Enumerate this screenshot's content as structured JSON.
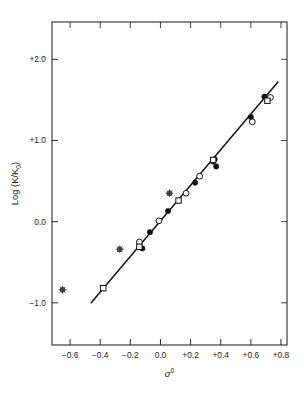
{
  "chart_data": {
    "type": "scatter",
    "title": "",
    "xlabel": "σ⁰",
    "ylabel": "Log (K/K₀)",
    "xlim": [
      -0.72,
      0.84
    ],
    "ylim": [
      -1.52,
      2.46
    ],
    "grid": false,
    "legend": "none",
    "xticks": [
      -0.6,
      -0.4,
      -0.2,
      0.0,
      0.2,
      0.4,
      0.6,
      0.8
    ],
    "xticklabels": [
      "−0.6",
      "−0.4",
      "−0.2",
      "0.0",
      "+0.2",
      "+0.4",
      "+0.6",
      "+0.8"
    ],
    "yticks": [
      -1.0,
      0.0,
      1.0,
      2.0
    ],
    "yticklabels": [
      "−1.0",
      "0.0",
      "+1.0",
      "+2.0"
    ],
    "fit_line": {
      "x_start": -0.46,
      "y_start": -1.0,
      "x_end": 0.78,
      "y_end": 1.72,
      "slope": 2.19,
      "intercept": 0.008
    },
    "series": [
      {
        "name": "filled-circle",
        "marker": "filled circle",
        "points": [
          {
            "x": -0.12,
            "y": -0.33
          },
          {
            "x": -0.07,
            "y": -0.13
          },
          {
            "x": 0.05,
            "y": 0.13
          },
          {
            "x": 0.23,
            "y": 0.48
          },
          {
            "x": 0.35,
            "y": 0.74
          },
          {
            "x": 0.36,
            "y": 0.77
          },
          {
            "x": 0.37,
            "y": 0.68
          },
          {
            "x": 0.6,
            "y": 1.29
          },
          {
            "x": 0.69,
            "y": 1.54
          }
        ]
      },
      {
        "name": "open-circle",
        "marker": "open circle",
        "points": [
          {
            "x": -0.14,
            "y": -0.25
          },
          {
            "x": -0.01,
            "y": 0.01
          },
          {
            "x": 0.17,
            "y": 0.35
          },
          {
            "x": 0.26,
            "y": 0.56
          },
          {
            "x": 0.61,
            "y": 1.23
          },
          {
            "x": 0.73,
            "y": 1.53
          }
        ]
      },
      {
        "name": "open-square",
        "marker": "open square",
        "points": [
          {
            "x": -0.38,
            "y": -0.82
          },
          {
            "x": -0.14,
            "y": -0.31
          },
          {
            "x": 0.12,
            "y": 0.26
          },
          {
            "x": 0.35,
            "y": 0.76
          },
          {
            "x": 0.71,
            "y": 1.49
          }
        ]
      },
      {
        "name": "crossed-circle",
        "marker": "crossed circle",
        "points": [
          {
            "x": -0.65,
            "y": -0.84
          },
          {
            "x": -0.27,
            "y": -0.34
          },
          {
            "x": 0.06,
            "y": 0.35
          }
        ]
      }
    ]
  }
}
